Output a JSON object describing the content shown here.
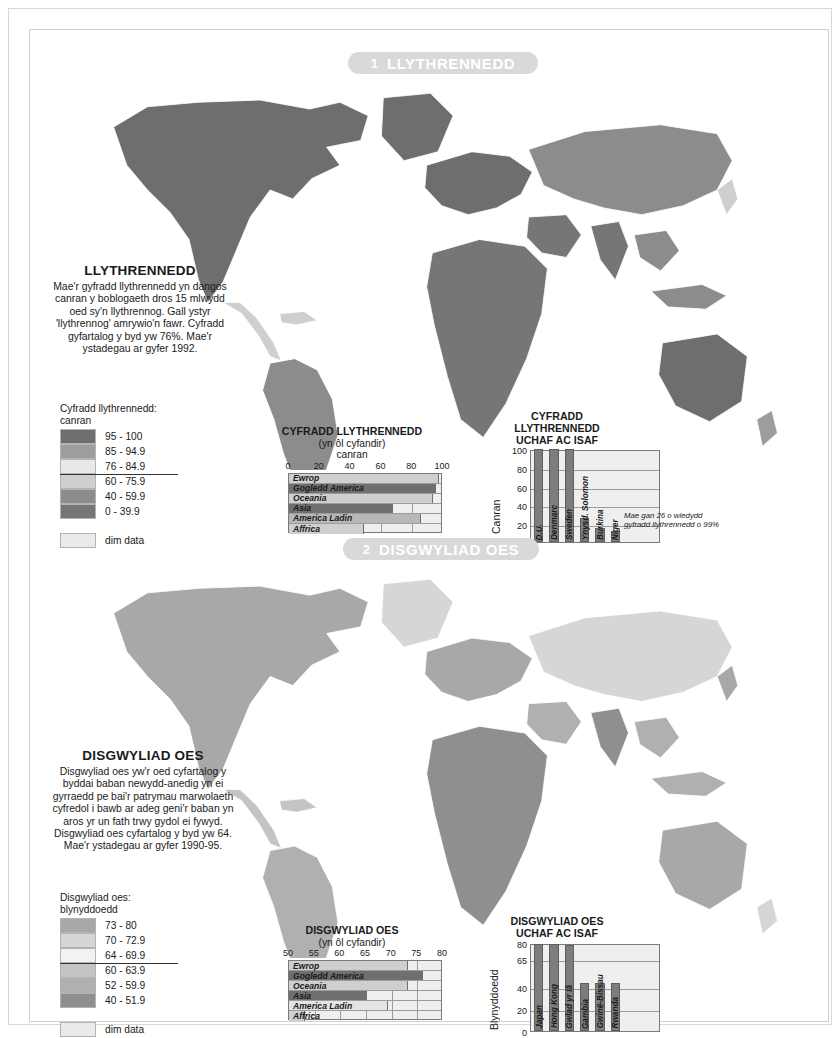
{
  "sections": [
    {
      "number": "1",
      "banner_title": "LLYTHRENNEDD",
      "text_title": "LLYTHRENNEDD",
      "text_body": "Mae'r gyfradd llythrennedd yn dangos canran y boblogaeth dros 15 mlwydd oed sy'n llythrennog. Gall ystyr 'llythrennog' amrywio'n fawr. Cyfradd gyfartalog y byd yw 76%. Mae'r ystadegau ar gyfer 1992.",
      "legend_title_1": "Cyfradd llythrennedd:",
      "legend_title_2": "canran",
      "legend_items": [
        {
          "label": "95 - 100",
          "color": "#6e6e6e"
        },
        {
          "label": "85 - 94.9",
          "color": "#9d9d9d"
        },
        {
          "label": "76 - 84.9",
          "color": "#e9e9e9"
        },
        {
          "label": "60 - 75.9",
          "color": "#cfcfcf"
        },
        {
          "label": "40 - 59.9",
          "color": "#8c8c8c"
        },
        {
          "label": "0 - 39.9",
          "color": "#767676"
        }
      ],
      "nodata_label": "dim data",
      "nodata_color": "#eaeaea"
    },
    {
      "number": "2",
      "banner_title": "DISGWYLIAD OES",
      "text_title": "DISGWYLIAD OES",
      "text_body": "Disgwyliad oes yw'r oed cyfartalog y byddai baban newydd-anedig yn ei gyrraedd pe bai'r patrymau marwolaeth cyfredol i bawb ar adeg geni'r baban yn aros yr un fath trwy gydol ei fywyd. Disgwyliad oes cyfartalog y byd yw 64. Mae'r ystadegau ar gyfer 1990-95.",
      "legend_title_1": "Disgwyliad oes:",
      "legend_title_2": "blynyddoedd",
      "legend_items": [
        {
          "label": "73 - 80",
          "color": "#a8a8a8"
        },
        {
          "label": "70 - 72.9",
          "color": "#d6d6d6"
        },
        {
          "label": "64 - 69.9",
          "color": "#f2f2f2"
        },
        {
          "label": "60 - 63.9",
          "color": "#c4c4c4"
        },
        {
          "label": "52 - 59.9",
          "color": "#b0b0b0"
        },
        {
          "label": "40 - 51.9",
          "color": "#8f8f8f"
        }
      ],
      "nodata_label": "dim data",
      "nodata_color": "#eaeaea"
    }
  ],
  "chart_data": [
    {
      "type": "bar",
      "orientation": "horizontal",
      "title": "CYFRADD LLYTHRENNEDD",
      "subtitle": "(yn ôl cyfandir)",
      "unit_label": "canran",
      "xlabel": "",
      "ylabel": "",
      "xlim": [
        0,
        100
      ],
      "ticks": [
        0,
        20,
        40,
        60,
        80,
        100
      ],
      "grid": true,
      "categories": [
        "Ewrop",
        "Gogledd America",
        "Oceania",
        "Asia",
        "America Ladin",
        "Affrica"
      ],
      "values": [
        97,
        95,
        93,
        67,
        85,
        48
      ],
      "bar_colors": [
        "#cfcfcf",
        "#6f6f6f",
        "#cfcfcf",
        "#6f6f6f",
        "#b8b8b8",
        "#cfcfcf"
      ]
    },
    {
      "type": "bar",
      "orientation": "vertical",
      "title_line1": "CYFRADD LLYTHRENNEDD",
      "title_line2": "UCHAF AC ISAF",
      "ylabel": "Canran",
      "ylim": [
        0,
        100
      ],
      "ticks": [
        0,
        20,
        40,
        60,
        80,
        100
      ],
      "grid": true,
      "categories": [
        "D.U.",
        "Denmarc",
        "Sweden",
        "Ynysd. Solomon",
        "Burkina",
        "Niger"
      ],
      "values": [
        100,
        100,
        100,
        26,
        15,
        12
      ],
      "annotation": "Mae gan 26 o wledydd gyfradd llythrennedd o 99%"
    },
    {
      "type": "bar",
      "orientation": "horizontal",
      "title": "DISGWYLIAD OES",
      "subtitle": "(yn ôl cyfandir)",
      "unit_label": "",
      "xlim": [
        50,
        80
      ],
      "ticks": [
        50,
        55,
        60,
        65,
        70,
        75,
        80
      ],
      "grid": true,
      "categories": [
        "Ewrop",
        "Gogledd America",
        "Oceania",
        "Asia",
        "America Ladin",
        "Affrica"
      ],
      "values": [
        73,
        76,
        73,
        65,
        69,
        53
      ],
      "bar_colors": [
        "#cfcfcf",
        "#6f6f6f",
        "#cfcfcf",
        "#6f6f6f",
        "#e4e4e4",
        "#cfcfcf"
      ]
    },
    {
      "type": "bar",
      "orientation": "vertical",
      "title_line1": "DISGWYLIAD OES",
      "title_line2": "UCHAF AC ISAF",
      "ylabel": "Blynyddoedd",
      "ylim": [
        0,
        80
      ],
      "ticks": [
        0,
        20,
        40,
        65,
        80
      ],
      "grid": true,
      "categories": [
        "Japan",
        "Hong Kong",
        "Gwlad yr Iâ",
        "Gambia",
        "Gwinë-Bissau",
        "Rwanda"
      ],
      "values": [
        79,
        79,
        78,
        43,
        43,
        43
      ],
      "annotation": ""
    }
  ]
}
